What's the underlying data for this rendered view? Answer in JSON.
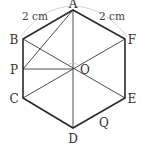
{
  "figure": {
    "type": "regular-hexagon",
    "center_label": "O",
    "vertices": [
      {
        "name": "A",
        "x": 73,
        "y": 10,
        "label_x": 73,
        "label_y": 7
      },
      {
        "name": "B",
        "x": 23,
        "y": 39,
        "label_x": 13,
        "label_y": 44
      },
      {
        "name": "C",
        "x": 23,
        "y": 98,
        "label_x": 13,
        "label_y": 103
      },
      {
        "name": "D",
        "x": 73,
        "y": 128,
        "label_x": 73,
        "label_y": 143
      },
      {
        "name": "E",
        "x": 125,
        "y": 98,
        "label_x": 132,
        "label_y": 103
      },
      {
        "name": "F",
        "x": 125,
        "y": 39,
        "label_x": 132,
        "label_y": 44
      }
    ],
    "points": [
      {
        "name": "O",
        "x": 73,
        "y": 69,
        "label_x": 86,
        "label_y": 74
      },
      {
        "name": "P",
        "x": 23,
        "y": 69,
        "label_x": 13,
        "label_y": 74
      },
      {
        "name": "Q",
        "x": 100,
        "y": 113,
        "label_x": 104,
        "label_y": 127
      }
    ],
    "labels": {
      "A": "A",
      "B": "B",
      "C": "C",
      "D": "D",
      "E": "E",
      "F": "F",
      "O": "O",
      "P": "P",
      "Q": "Q"
    },
    "dimensions": {
      "left": "2 cm",
      "right": "2 cm"
    },
    "segments": [
      "AB",
      "BC",
      "CD",
      "DE",
      "EF",
      "FA",
      "AD",
      "BE",
      "CF",
      "PO",
      "AP"
    ],
    "colors": {
      "edge": "#2a2a2a",
      "inner": "#3a3a3a",
      "arc": "#c8c8c8",
      "text": "#333333"
    }
  }
}
